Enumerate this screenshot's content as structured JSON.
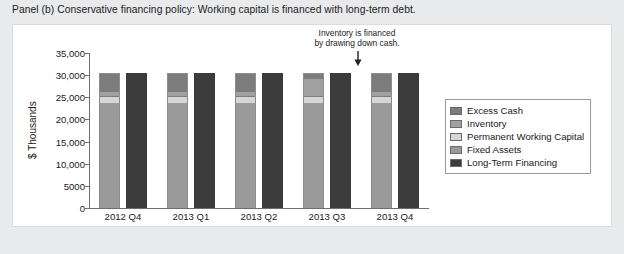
{
  "panel": {
    "title": "Panel (b) Conservative financing policy: Working capital is financed with long-term debt."
  },
  "annotation": {
    "line1": "Inventory is financed",
    "line2": "by drawing down cash.",
    "arrow_icon": "down-arrow-icon",
    "points_at": "2013 Q3"
  },
  "legend": {
    "position": "right-inside",
    "items": [
      {
        "label": "Excess Cash",
        "color": "#7c7c7c"
      },
      {
        "label": "Inventory",
        "color": "#a0a0a0"
      },
      {
        "label": "Permanent Working Capital",
        "color": "#d6d6d6"
      },
      {
        "label": "Fixed Assets",
        "color": "#9a9a9a"
      },
      {
        "label": "Long-Term Financing",
        "color": "#3c3c3c"
      }
    ]
  },
  "chart_data": {
    "type": "bar",
    "subtype": "stacked-grouped",
    "title": "",
    "xlabel": "",
    "ylabel": "$ Thousands",
    "ylim": [
      0,
      35000
    ],
    "yticks": [
      0,
      5000,
      10000,
      15000,
      20000,
      25000,
      30000,
      35000
    ],
    "ytick_labels": [
      "0",
      "5000",
      "10,000",
      "15,000",
      "20,000",
      "25,000",
      "30,000",
      "35,000"
    ],
    "grid": false,
    "categories": [
      "2012 Q4",
      "2013 Q1",
      "2013 Q2",
      "2013 Q3",
      "2013 Q4"
    ],
    "bar_sets": [
      {
        "name": "Assets",
        "stacked_series": [
          {
            "name": "Fixed Assets",
            "color": "#9a9a9a",
            "values": [
              24000,
              24000,
              24000,
              24000,
              24000
            ]
          },
          {
            "name": "Permanent Working Capital",
            "color": "#d6d6d6",
            "values": [
              1500,
              1500,
              1500,
              1500,
              1500
            ]
          },
          {
            "name": "Inventory",
            "color": "#a0a0a0",
            "values": [
              1200,
              1200,
              1200,
              4000,
              1200
            ]
          },
          {
            "name": "Excess Cash",
            "color": "#7c7c7c",
            "values": [
              3800,
              3800,
              3800,
              1000,
              3800
            ]
          }
        ],
        "totals": [
          30500,
          30500,
          30500,
          30500,
          30500
        ]
      },
      {
        "name": "Financing",
        "stacked_series": [
          {
            "name": "Long-Term Financing",
            "color": "#3c3c3c",
            "values": [
              30500,
              30500,
              30500,
              30500,
              30500
            ]
          }
        ],
        "totals": [
          30500,
          30500,
          30500,
          30500,
          30500
        ]
      }
    ]
  }
}
